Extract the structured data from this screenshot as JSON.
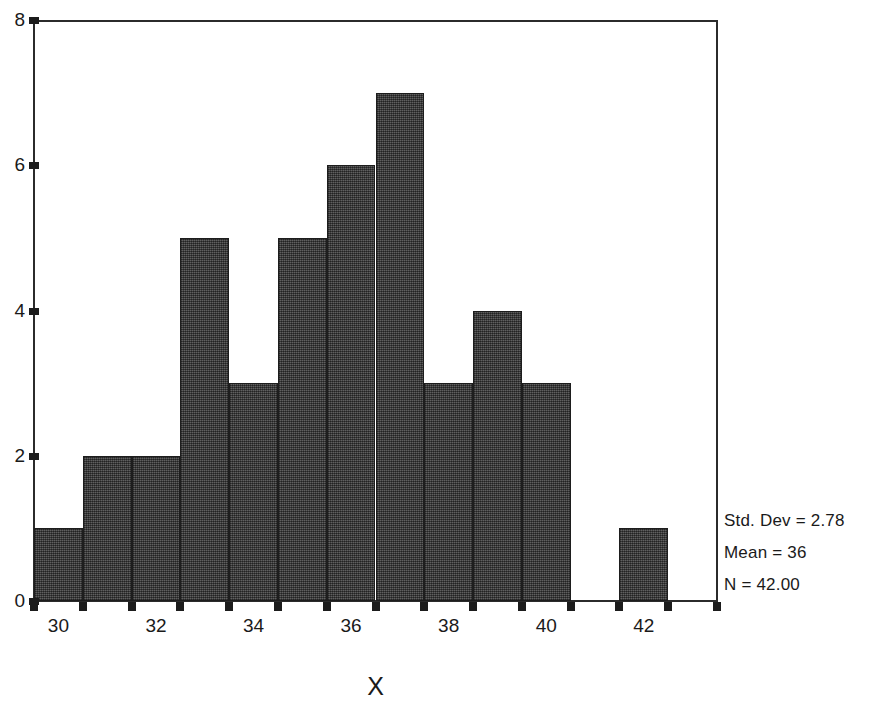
{
  "chart_data": {
    "type": "bar",
    "title": "",
    "subtitle": "",
    "xlabel": "X",
    "ylabel": "",
    "categories": [
      29.5,
      30.5,
      31.5,
      32.5,
      33.5,
      34.5,
      35.5,
      36.5,
      37.5,
      38.5,
      39.5,
      40.5,
      41.5,
      42.5
    ],
    "bin_centers": [
      30,
      31,
      32,
      33,
      34,
      35,
      36,
      37,
      38,
      39,
      40,
      41,
      42,
      43
    ],
    "values": [
      1,
      2,
      2,
      5,
      3,
      5,
      6,
      7,
      3,
      4,
      3,
      0,
      1,
      0
    ],
    "bin_width": 1,
    "xlim": [
      29.5,
      43.5
    ],
    "ylim": [
      0,
      8
    ],
    "x_ticks": [
      29.5,
      30.5,
      31.5,
      32.5,
      33.5,
      34.5,
      35.5,
      36.5,
      37.5,
      38.5,
      39.5,
      40.5,
      41.5,
      42.5,
      43.5
    ],
    "x_tick_labels": [
      "",
      "30",
      "",
      "32",
      "",
      "34",
      "",
      "36",
      "",
      "38",
      "",
      "40",
      "",
      "42",
      ""
    ],
    "x_tick_label_values": [
      30,
      32,
      34,
      36,
      38,
      40,
      42
    ],
    "y_ticks": [
      0,
      2,
      4,
      6,
      8
    ],
    "y_tick_labels": [
      "0",
      "2",
      "4",
      "6",
      "8"
    ],
    "grid": false,
    "legend": false,
    "bar_color": "#4d4d4d",
    "bar_edge_color": "#1d1d1d",
    "axis_color": "#2b2b2b",
    "background_color": "#ffffff"
  },
  "annotations": {
    "std_dev": "Std. Dev = 2.78",
    "mean": "Mean = 36",
    "n": "N = 42.00"
  },
  "axis": {
    "x_title": "X"
  }
}
